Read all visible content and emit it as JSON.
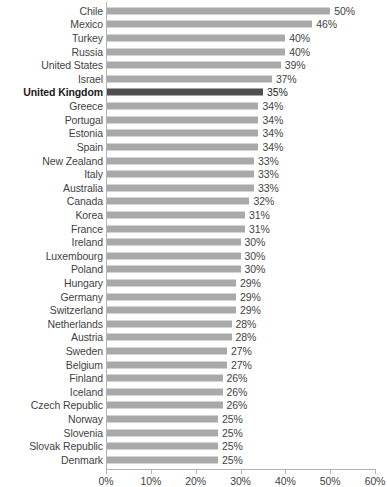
{
  "chart_data": {
    "type": "bar",
    "orientation": "horizontal",
    "title": "",
    "subtitle": "",
    "xlabel": "",
    "ylabel": "",
    "xlim": [
      0,
      60
    ],
    "xticks": [
      0,
      10,
      20,
      30,
      40,
      50,
      60
    ],
    "xtick_labels": [
      "0%",
      "10%",
      "20%",
      "30%",
      "40%",
      "50%",
      "60%"
    ],
    "grid": false,
    "legend": null,
    "value_label_suffix": "%",
    "colors": {
      "bar": "#a9a9a9",
      "bar_highlight": "#4f4f4f",
      "axis": "#b3b3b3",
      "text": "#3f3f3f",
      "text_highlight": "#1a1a1a",
      "background": "#ffffff"
    },
    "highlight_category": "United Kingdom",
    "categories": [
      "Chile",
      "Mexico",
      "Turkey",
      "Russia",
      "United States",
      "Israel",
      "United Kingdom",
      "Greece",
      "Portugal",
      "Estonia",
      "Spain",
      "New Zealand",
      "Italy",
      "Australia",
      "Canada",
      "Korea",
      "France",
      "Ireland",
      "Luxembourg",
      "Poland",
      "Hungary",
      "Germany",
      "Switzerland",
      "Netherlands",
      "Austria",
      "Sweden",
      "Belgium",
      "Finland",
      "Iceland",
      "Czech Republic",
      "Norway",
      "Slovenia",
      "Slovak Republic",
      "Denmark"
    ],
    "values": [
      50,
      46,
      40,
      40,
      39,
      37,
      35,
      34,
      34,
      34,
      34,
      33,
      33,
      33,
      32,
      31,
      31,
      30,
      30,
      30,
      29,
      29,
      29,
      28,
      28,
      27,
      27,
      26,
      26,
      26,
      25,
      25,
      25,
      25
    ],
    "value_labels": [
      "50%",
      "46%",
      "40%",
      "40%",
      "39%",
      "37%",
      "35%",
      "34%",
      "34%",
      "34%",
      "34%",
      "33%",
      "33%",
      "33%",
      "32%",
      "31%",
      "31%",
      "30%",
      "30%",
      "30%",
      "29%",
      "29%",
      "29%",
      "28%",
      "28%",
      "27%",
      "27%",
      "26%",
      "26%",
      "26%",
      "25%",
      "25%",
      "25%",
      "25%"
    ],
    "bars": [
      {
        "category": "Chile",
        "value": 50,
        "label": "50%",
        "highlight": false
      },
      {
        "category": "Mexico",
        "value": 46,
        "label": "46%",
        "highlight": false
      },
      {
        "category": "Turkey",
        "value": 40,
        "label": "40%",
        "highlight": false
      },
      {
        "category": "Russia",
        "value": 40,
        "label": "40%",
        "highlight": false
      },
      {
        "category": "United States",
        "value": 39,
        "label": "39%",
        "highlight": false
      },
      {
        "category": "Israel",
        "value": 37,
        "label": "37%",
        "highlight": false
      },
      {
        "category": "United Kingdom",
        "value": 35,
        "label": "35%",
        "highlight": true
      },
      {
        "category": "Greece",
        "value": 34,
        "label": "34%",
        "highlight": false
      },
      {
        "category": "Portugal",
        "value": 34,
        "label": "34%",
        "highlight": false
      },
      {
        "category": "Estonia",
        "value": 34,
        "label": "34%",
        "highlight": false
      },
      {
        "category": "Spain",
        "value": 34,
        "label": "34%",
        "highlight": false
      },
      {
        "category": "New Zealand",
        "value": 33,
        "label": "33%",
        "highlight": false
      },
      {
        "category": "Italy",
        "value": 33,
        "label": "33%",
        "highlight": false
      },
      {
        "category": "Australia",
        "value": 33,
        "label": "33%",
        "highlight": false
      },
      {
        "category": "Canada",
        "value": 32,
        "label": "32%",
        "highlight": false
      },
      {
        "category": "Korea",
        "value": 31,
        "label": "31%",
        "highlight": false
      },
      {
        "category": "France",
        "value": 31,
        "label": "31%",
        "highlight": false
      },
      {
        "category": "Ireland",
        "value": 30,
        "label": "30%",
        "highlight": false
      },
      {
        "category": "Luxembourg",
        "value": 30,
        "label": "30%",
        "highlight": false
      },
      {
        "category": "Poland",
        "value": 30,
        "label": "30%",
        "highlight": false
      },
      {
        "category": "Hungary",
        "value": 29,
        "label": "29%",
        "highlight": false
      },
      {
        "category": "Germany",
        "value": 29,
        "label": "29%",
        "highlight": false
      },
      {
        "category": "Switzerland",
        "value": 29,
        "label": "29%",
        "highlight": false
      },
      {
        "category": "Netherlands",
        "value": 28,
        "label": "28%",
        "highlight": false
      },
      {
        "category": "Austria",
        "value": 28,
        "label": "28%",
        "highlight": false
      },
      {
        "category": "Sweden",
        "value": 27,
        "label": "27%",
        "highlight": false
      },
      {
        "category": "Belgium",
        "value": 27,
        "label": "27%",
        "highlight": false
      },
      {
        "category": "Finland",
        "value": 26,
        "label": "26%",
        "highlight": false
      },
      {
        "category": "Iceland",
        "value": 26,
        "label": "26%",
        "highlight": false
      },
      {
        "category": "Czech Republic",
        "value": 26,
        "label": "26%",
        "highlight": false
      },
      {
        "category": "Norway",
        "value": 25,
        "label": "25%",
        "highlight": false
      },
      {
        "category": "Slovenia",
        "value": 25,
        "label": "25%",
        "highlight": false
      },
      {
        "category": "Slovak Republic",
        "value": 25,
        "label": "25%",
        "highlight": false
      },
      {
        "category": "Denmark",
        "value": 25,
        "label": "25%",
        "highlight": false
      }
    ]
  }
}
